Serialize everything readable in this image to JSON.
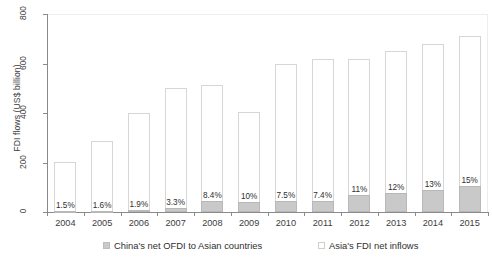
{
  "chart_data": {
    "type": "bar",
    "title": "",
    "subtitle": "",
    "xlabel": "",
    "ylabel": "FDI flows (US$ billion)",
    "ylim": [
      0,
      800
    ],
    "yticks": [
      0,
      200,
      400,
      600,
      800
    ],
    "ytick_labels": [
      "0",
      "200",
      "400",
      "600",
      "800"
    ],
    "grid": false,
    "legend_position": "bottom",
    "stacked": true,
    "categories": [
      "2004",
      "2005",
      "2006",
      "2007",
      "2008",
      "2009",
      "2010",
      "2011",
      "2012",
      "2013",
      "2014",
      "2015"
    ],
    "series": [
      {
        "name": "Asia's FDI net inflows",
        "color": "#ffffff",
        "border_color": "#d6d6d6",
        "values": [
          202,
          285,
          400,
          500,
          515,
          405,
          598,
          618,
          618,
          650,
          680,
          710
        ]
      },
      {
        "name": "China's net OFDI to Asian countries",
        "color": "#c9c9c9",
        "border_color": "#b8b8b8",
        "values": [
          3.0,
          4.6,
          7.6,
          16.5,
          43.3,
          40.5,
          44.9,
          45.7,
          68.0,
          78.0,
          88.4,
          106.5
        ]
      }
    ],
    "point_labels": [
      "1.5%",
      "1.6%",
      "1.9%",
      "3.3%",
      "8.4%",
      "10%",
      "7.5%",
      "7.4%",
      "11%",
      "12%",
      "13%",
      "15%"
    ],
    "point_label_note": "China's net OFDI as share of Asia's FDI net inflows"
  },
  "legend": {
    "entries": [
      {
        "label": "China's net OFDI to Asian countries",
        "swatch": "filled"
      },
      {
        "label": "Asia's FDI net inflows",
        "swatch": "hollow"
      }
    ]
  }
}
